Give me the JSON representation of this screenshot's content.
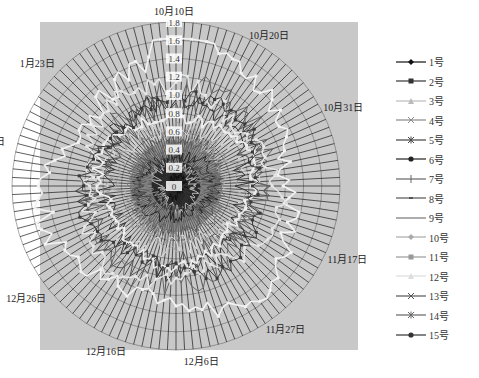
{
  "chart_data": {
    "type": "radar",
    "title": "",
    "radial_axis": {
      "min": 0,
      "max": 1.8,
      "step": 0.2,
      "tick_labels": [
        "0",
        "0.2",
        "0.4",
        "0.6",
        "0.8",
        "1.0",
        "1.2",
        "1.4",
        "1.6",
        "1.8"
      ]
    },
    "num_spokes": 120,
    "start_date_label": "10月10日",
    "date_labels": [
      {
        "label": "10月10日",
        "index": 0
      },
      {
        "label": "10月20日",
        "index": 10
      },
      {
        "label": "10月31日",
        "index": 21
      },
      {
        "label": "11月17日",
        "index": 38
      },
      {
        "label": "11月27日",
        "index": 48
      },
      {
        "label": "12月6日",
        "index": 57
      },
      {
        "label": "12月16日",
        "index": 67
      },
      {
        "label": "12月26日",
        "index": 77
      },
      {
        "label": "1月13日",
        "index": 95
      },
      {
        "label": "1月23日",
        "index": 105
      }
    ],
    "legend_position": "right",
    "grid": true,
    "series": [
      {
        "name": "1号",
        "marker": "diamond",
        "color": "#111111",
        "base": 0.1,
        "amp": 0.05
      },
      {
        "name": "2号",
        "marker": "square",
        "color": "#333333",
        "base": 0.16,
        "amp": 0.06
      },
      {
        "name": "3号",
        "marker": "triangle",
        "color": "#bbbbbb",
        "base": 0.22,
        "amp": 0.06
      },
      {
        "name": "4号",
        "marker": "x",
        "color": "#888888",
        "base": 0.28,
        "amp": 0.07
      },
      {
        "name": "5号",
        "marker": "star",
        "color": "#444444",
        "base": 0.33,
        "amp": 0.07
      },
      {
        "name": "6号",
        "marker": "circle",
        "color": "#222222",
        "base": 0.38,
        "amp": 0.08
      },
      {
        "name": "7号",
        "marker": "plus",
        "color": "#666666",
        "base": 0.44,
        "amp": 0.08
      },
      {
        "name": "8号",
        "marker": "dash",
        "color": "#555555",
        "base": 0.48,
        "amp": 0.08
      },
      {
        "name": "9号",
        "marker": "none",
        "color": "#777777",
        "base": 0.52,
        "amp": 0.08
      },
      {
        "name": "10号",
        "marker": "diamond",
        "color": "#aaaaaa",
        "base": 0.62,
        "amp": 0.1
      },
      {
        "name": "11号",
        "marker": "square",
        "color": "#999999",
        "base": 0.68,
        "amp": 0.1
      },
      {
        "name": "12号",
        "marker": "triangle",
        "color": "#dddddd",
        "base": 0.75,
        "amp": 0.12
      },
      {
        "name": "13号",
        "marker": "x",
        "color": "#555555",
        "base": 0.9,
        "amp": 0.14
      },
      {
        "name": "14号",
        "marker": "star",
        "color": "#666666",
        "base": 1.0,
        "amp": 0.15
      },
      {
        "name": "15号",
        "marker": "circle",
        "color": "#333333",
        "base": 0.85,
        "amp": 0.12
      }
    ],
    "outer_series_hint": [
      {
        "name": "12号",
        "approx_peak": 1.65,
        "peak_label": "10月10日"
      },
      {
        "name": "10号",
        "approx_peak": 1.45,
        "peak_label": "10月20日"
      },
      {
        "name": "15号",
        "approx_peak": 1.15,
        "peak_label": "1月23日"
      }
    ]
  },
  "legend": {
    "items": [
      "1号",
      "2号",
      "3号",
      "4号",
      "5号",
      "6号",
      "7号",
      "8号",
      "9号",
      "10号",
      "11号",
      "12号",
      "13号",
      "14号",
      "15号"
    ]
  },
  "colors": {
    "plot_background": "#c8c8c8",
    "spoke": "#1a1a1a",
    "grid_ring": "#555555"
  }
}
